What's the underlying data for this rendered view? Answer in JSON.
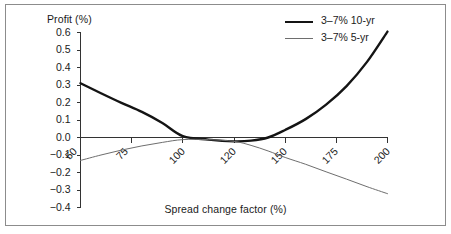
{
  "chart_data": {
    "type": "line",
    "title": "",
    "xlabel": "Spread change factor (%)",
    "ylabel": "Profit (%)",
    "xlim": [
      50,
      200
    ],
    "ylim": [
      -0.4,
      0.6
    ],
    "grid": false,
    "legend_position": "top-right",
    "xticks": [
      50,
      75,
      100,
      120,
      150,
      175,
      200
    ],
    "xtick_labels": [
      "50",
      "75",
      "100",
      "120",
      "150",
      "175",
      "200"
    ],
    "yticks": [
      0.6,
      0.5,
      0.4,
      0.3,
      0.2,
      0.1,
      0.0,
      -0.1,
      -0.2,
      -0.3,
      -0.4
    ],
    "ytick_labels": [
      "0.6",
      "0.5",
      "0.4",
      "0.3",
      "0.2",
      "0.1",
      "0.0",
      "−0.1",
      "−0.2",
      "−0.3",
      "−0.4"
    ],
    "series": [
      {
        "name": "3–7% 10-yr",
        "color": "#141414",
        "width": 2.4,
        "x": [
          50,
          60,
          70,
          80,
          90,
          100,
          110,
          120,
          130,
          140,
          150,
          160,
          170,
          180,
          190,
          200
        ],
        "values": [
          0.31,
          0.253,
          0.198,
          0.146,
          0.083,
          0.008,
          -0.012,
          -0.022,
          -0.018,
          0.0,
          0.043,
          0.105,
          0.188,
          0.294,
          0.432,
          0.605
        ]
      },
      {
        "name": "3–7% 5-yr",
        "color": "#6e6e6e",
        "width": 1.0,
        "x": [
          50,
          60,
          70,
          80,
          90,
          100,
          110,
          120,
          130,
          140,
          150,
          160,
          170,
          180,
          190,
          200
        ],
        "values": [
          -0.131,
          -0.1,
          -0.072,
          -0.048,
          -0.028,
          -0.012,
          -0.012,
          -0.022,
          -0.045,
          -0.077,
          -0.114,
          -0.153,
          -0.196,
          -0.238,
          -0.281,
          -0.321
        ]
      }
    ]
  },
  "legend": {
    "entries": [
      {
        "label": "3–7% 10-yr",
        "style": "thick"
      },
      {
        "label": "3–7% 5-yr",
        "style": "thin"
      }
    ]
  },
  "colors": {
    "frame": "#8c8c8c",
    "axis": "#333333",
    "text": "#1a1a1a",
    "series_10yr": "#141414",
    "series_5yr": "#6e6e6e",
    "background": "#ffffff"
  }
}
